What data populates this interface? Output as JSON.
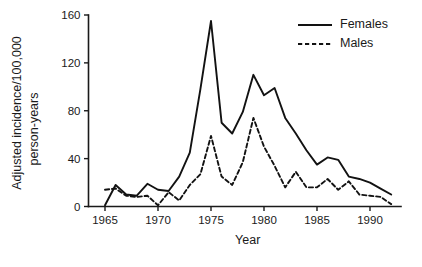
{
  "chart_data": {
    "type": "line",
    "title": "",
    "xlabel": "Year",
    "ylabel": "Adjusted incidence/100,000 person-years",
    "ylabel_line1": "Adjusted incidence/100,000",
    "ylabel_line2": "person-years",
    "xlim": [
      1965,
      1992
    ],
    "ylim": [
      0,
      160
    ],
    "xticks": [
      1965,
      1970,
      1975,
      1980,
      1985,
      1990
    ],
    "yticks": [
      0,
      40,
      80,
      120,
      160
    ],
    "xtick_labels": [
      "1965",
      "1970",
      "1975",
      "1980",
      "1985",
      "1990"
    ],
    "ytick_labels": [
      "0",
      "40",
      "80",
      "120",
      "160"
    ],
    "grid": false,
    "legend_position": "top-right",
    "x": [
      1965,
      1966,
      1967,
      1968,
      1969,
      1970,
      1971,
      1972,
      1973,
      1974,
      1975,
      1976,
      1977,
      1978,
      1979,
      1980,
      1981,
      1982,
      1983,
      1984,
      1985,
      1986,
      1987,
      1988,
      1989,
      1990,
      1991,
      1992
    ],
    "series": [
      {
        "name": "Females",
        "style": "solid",
        "color": "#121212",
        "values": [
          1,
          18,
          10,
          9,
          19,
          14,
          13,
          25,
          45,
          98,
          155,
          70,
          61,
          79,
          110,
          93,
          99,
          74,
          61,
          47,
          35,
          41,
          39,
          25,
          23,
          20,
          15,
          10
        ]
      },
      {
        "name": "Males",
        "style": "dashed",
        "color": "#121212",
        "values": [
          14,
          15,
          9,
          8,
          9,
          1,
          12,
          5,
          18,
          27,
          59,
          25,
          18,
          37,
          74,
          50,
          34,
          16,
          29,
          16,
          16,
          23,
          14,
          21,
          10,
          9,
          8,
          2
        ]
      }
    ]
  },
  "legend": {
    "items": [
      {
        "label": "Females",
        "style": "solid"
      },
      {
        "label": "Males",
        "style": "dashed"
      }
    ]
  }
}
